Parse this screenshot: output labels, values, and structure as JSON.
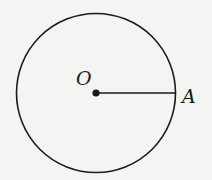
{
  "diagram": {
    "type": "circle-with-radius",
    "center_label": "O",
    "point_label": "A",
    "colors": {
      "stroke": "#1a1a1a",
      "background": "#f4f4f2"
    }
  }
}
